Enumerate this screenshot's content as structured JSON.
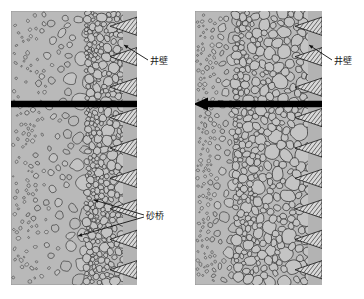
{
  "figure": {
    "type": "technical-diagram",
    "background_color": "#ffffff",
    "panel_fill_color": "#b9b9b9",
    "grain_fill_color": "#c4c4c4",
    "grain_stroke_color": "#2b2b2b",
    "hatch_color": "#1f1f1f",
    "arrow_color": "#000000",
    "label_color": "#1a1a1a"
  },
  "panels": [
    {
      "id": "left",
      "name": "before-sand-bridge-growth",
      "x": 11,
      "y": 11,
      "width": 126,
      "height": 274,
      "pack_zone_start_ratio": 0.62,
      "arrow": {
        "type": "single",
        "direction": "right",
        "y": 104
      },
      "labels": [
        {
          "id": "well-wall",
          "text": "井壁",
          "x": 150,
          "y": 57,
          "leaders": [
            {
              "x1": 148,
              "y1": 60,
              "x2": 124,
              "y2": 45
            }
          ]
        },
        {
          "id": "sand-bridge",
          "text": "砂桥",
          "x": 146,
          "y": 212,
          "leaders": [
            {
              "x1": 144,
              "y1": 215,
              "x2": 94,
              "y2": 200
            },
            {
              "x1": 144,
              "y1": 217,
              "x2": 78,
              "y2": 236
            }
          ]
        }
      ]
    },
    {
      "id": "right",
      "name": "after-sand-bridge-growth",
      "x": 195,
      "y": 11,
      "width": 127,
      "height": 274,
      "pack_zone_start_ratio": 0.34,
      "arrow": {
        "type": "double",
        "direction": "both",
        "y": 104
      },
      "labels": [
        {
          "id": "well-wall",
          "text": "井壁",
          "x": 334,
          "y": 57,
          "leaders": [
            {
              "x1": 332,
              "y1": 60,
              "x2": 309,
              "y2": 45
            }
          ]
        }
      ]
    }
  ],
  "legend_terms": {
    "well_wall": "井壁",
    "sand_bridge": "砂桥"
  }
}
